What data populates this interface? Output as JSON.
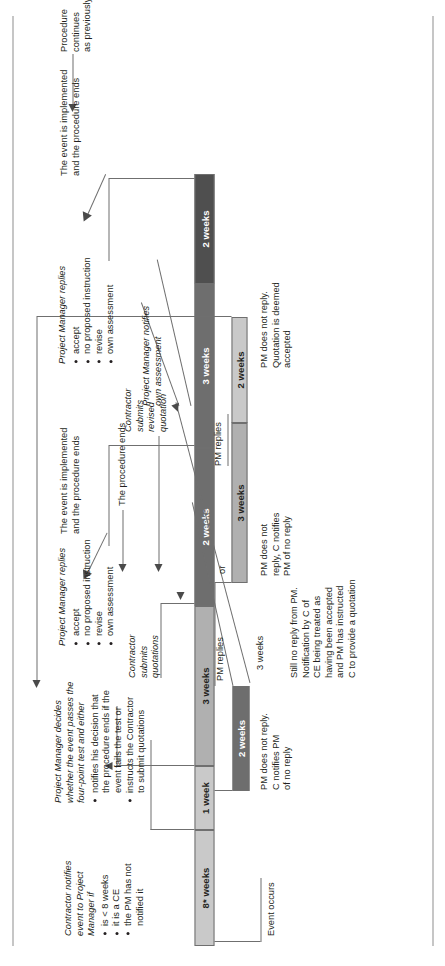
{
  "diagram": {
    "orientation": "rotated-90",
    "colors": {
      "bar_light": "#c9c9c9",
      "bar_mid": "#b0b0b0",
      "bar_dark": "#6e6e6e",
      "bar_darkest": "#4f4f4f",
      "line": "#6f6f6f",
      "text": "#231f20"
    }
  },
  "bars": [
    {
      "id": "bar-8-weeks",
      "label": "8* weeks",
      "shade": "light"
    },
    {
      "id": "bar-1-week",
      "label": "1 week",
      "shade": "light"
    },
    {
      "id": "bar-3-weeks-main",
      "label": "3 weeks",
      "shade": "mid"
    },
    {
      "id": "bar-2-weeks-main",
      "label": "2 weeks",
      "shade": "dark"
    },
    {
      "id": "bar-3-weeks-upper",
      "label": "3 weeks",
      "shade": "dark"
    },
    {
      "id": "bar-2-weeks-top",
      "label": "2 weeks",
      "shade": "darkest"
    },
    {
      "id": "bar-2-weeks-pm-noreply",
      "label": "2 weeks",
      "shade": "dark"
    },
    {
      "id": "bar-3-weeks-branch",
      "label": "3 weeks",
      "shade": "mid"
    },
    {
      "id": "bar-2-weeks-branch",
      "label": "2 weeks",
      "shade": "light"
    }
  ],
  "labels": {
    "event_occurs": "Event occurs",
    "contractor_notifies": {
      "head": "Contractor notifies\nevent to Project\nManager if",
      "bullets": [
        "is < 8 weeks",
        "it is a CE",
        "the PM has not\nnotified it"
      ]
    },
    "pm_decides": {
      "head": "Project Manager decides\nwhether the event passes the\nfour-point test and either",
      "bullets": [
        "notifies his decision that\nthe procedure ends if the\nevent fails the test or",
        "instructs the Contractor\nto submit quotations"
      ]
    },
    "pm_does_not_reply_c_notifies": "PM does not reply.\nC notifies PM\nof no reply",
    "contractor_submits_quotations": "Contractor\nsubmits\nquotations",
    "pm_replies_1": "PM replies",
    "three_weeks_note_1": "3 weeks",
    "still_no_reply": "Still no reply from PM.\nNotification by C of\nCE being treated as\nhaving been accepted\nand PM has instructed\nC to provide a quotation",
    "or_1": "or",
    "pm_does_not_reply_c_notifies_2": "PM does not\nreply, C notifies\nPM of no reply",
    "pm_replies_2": "PM replies",
    "pm_does_not_reply_deemed": "PM does not reply.\nQuotation is deemed\naccepted",
    "pm_replies_block": {
      "head": "Project Manager replies",
      "bullets": [
        "accept",
        "no proposed instruction",
        "revise",
        "own assessment"
      ]
    },
    "the_event_is_implemented_1": "The event is implemented\nand the procedure ends",
    "the_procedure_ends": "The procedure ends",
    "contractor_submits_revised": "Contractor\nsubmits\nrevised\nquotation",
    "pm_notifies_own_assessment": "Project Manager notifies\nown assessment",
    "pm_replies_block_2": {
      "head": "Project Manager replies",
      "bullets": [
        "accept",
        "no proposed instruction",
        "revise",
        "own assessment"
      ]
    },
    "the_event_is_implemented_2": "The event is implemented\nand the procedure ends",
    "procedure_continues": "Procedure\ncontinues\nas previously"
  }
}
